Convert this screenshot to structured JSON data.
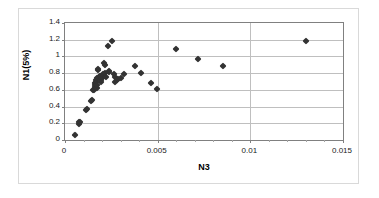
{
  "chart_data": {
    "type": "scatter",
    "title": "",
    "xlabel": "N3",
    "ylabel": "N1(5%)",
    "xlim": [
      0,
      0.015
    ],
    "ylim": [
      0,
      1.4
    ],
    "xticks": [
      "0",
      "0.005",
      "0.01",
      "0.015"
    ],
    "xtick_values": [
      0,
      0.005,
      0.01,
      0.015
    ],
    "yticks": [
      "0",
      "0.2",
      "0.4",
      "0.6",
      "0.8",
      "1",
      "1.2",
      "1.4"
    ],
    "ytick_values": [
      0,
      0.2,
      0.4,
      0.6,
      0.8,
      1,
      1.2,
      1.4
    ],
    "grid": "horizontal-and-vertical",
    "legend": "none",
    "marker_style": "filled-diamond",
    "marker_color": "#333333",
    "series": [
      {
        "name": "N1(5%) vs N3",
        "points": [
          [
            0.00055,
            0.055
          ],
          [
            0.00075,
            0.19
          ],
          [
            0.00077,
            0.21
          ],
          [
            0.0008,
            0.22
          ],
          [
            0.00112,
            0.36
          ],
          [
            0.0012,
            0.365
          ],
          [
            0.0014,
            0.47
          ],
          [
            0.00148,
            0.475
          ],
          [
            0.00152,
            0.595
          ],
          [
            0.00156,
            0.6
          ],
          [
            0.0016,
            0.64
          ],
          [
            0.00162,
            0.66
          ],
          [
            0.00163,
            0.68
          ],
          [
            0.00165,
            0.7
          ],
          [
            0.00168,
            0.72
          ],
          [
            0.0017,
            0.745
          ],
          [
            0.00172,
            0.625
          ],
          [
            0.00175,
            0.655
          ],
          [
            0.00178,
            0.84
          ],
          [
            0.0018,
            0.85
          ],
          [
            0.00185,
            0.755
          ],
          [
            0.00188,
            0.77
          ],
          [
            0.00192,
            0.7
          ],
          [
            0.00196,
            0.715
          ],
          [
            0.002,
            0.745
          ],
          [
            0.00205,
            0.79
          ],
          [
            0.0021,
            0.92
          ],
          [
            0.00215,
            0.9
          ],
          [
            0.00218,
            0.8
          ],
          [
            0.00222,
            0.755
          ],
          [
            0.0023,
            1.125
          ],
          [
            0.00235,
            0.82
          ],
          [
            0.0024,
            0.815
          ],
          [
            0.00255,
            1.18
          ],
          [
            0.00262,
            0.79
          ],
          [
            0.00268,
            0.75
          ],
          [
            0.00272,
            0.695
          ],
          [
            0.00278,
            0.715
          ],
          [
            0.00285,
            0.735
          ],
          [
            0.003,
            0.745
          ],
          [
            0.0032,
            0.79
          ],
          [
            0.00375,
            0.885
          ],
          [
            0.0041,
            0.8
          ],
          [
            0.00465,
            0.685
          ],
          [
            0.00495,
            0.605
          ],
          [
            0.006,
            1.085
          ],
          [
            0.00715,
            0.965
          ],
          [
            0.00855,
            0.885
          ],
          [
            0.013,
            1.19
          ]
        ]
      }
    ]
  }
}
